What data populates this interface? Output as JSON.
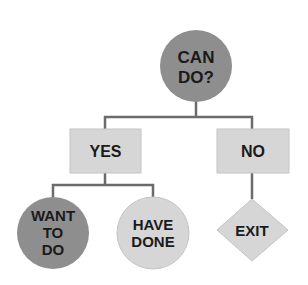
{
  "diagram": {
    "type": "decision-tree",
    "colors": {
      "dark_node": "#8e8e8e",
      "light_node": "#d6d6d6",
      "connector": "#6b6b6b",
      "text": "#1a1a1a",
      "background": "#ffffff"
    },
    "nodes": {
      "root": {
        "shape": "circle",
        "lines": [
          "CAN",
          "DO?"
        ]
      },
      "yes": {
        "shape": "rectangle",
        "label": "YES"
      },
      "no": {
        "shape": "rectangle",
        "label": "NO"
      },
      "want_to_do": {
        "shape": "circle",
        "lines": [
          "WANT",
          "TO",
          "DO"
        ]
      },
      "have_done": {
        "shape": "circle",
        "lines": [
          "HAVE",
          "DONE"
        ]
      },
      "exit": {
        "shape": "diamond",
        "label": "EXIT"
      }
    },
    "edges": [
      {
        "from": "root",
        "to": "yes"
      },
      {
        "from": "root",
        "to": "no"
      },
      {
        "from": "yes",
        "to": "want_to_do"
      },
      {
        "from": "yes",
        "to": "have_done"
      },
      {
        "from": "no",
        "to": "exit"
      }
    ]
  }
}
